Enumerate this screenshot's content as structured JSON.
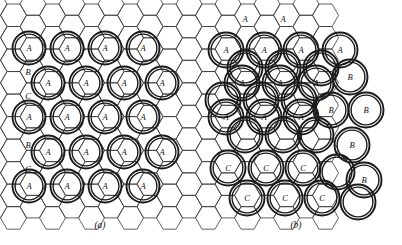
{
  "figure": {
    "type": "crystallography-stacking-diagram",
    "background_color": "#ffffff",
    "line_color": "#3a3a3a",
    "circle_color": "#1a1a1a",
    "width": 402,
    "height": 245
  },
  "panels": [
    {
      "id": "a",
      "caption": "(a)",
      "caption_x": 100,
      "caption_y": 228,
      "description": "ordered single-site occupation",
      "edge_labels": [
        {
          "text": "B",
          "x": 28,
          "y": 72
        },
        {
          "text": "C",
          "x": 28,
          "y": 96
        },
        {
          "text": "B",
          "x": 28,
          "y": 145
        },
        {
          "text": "C",
          "x": 28,
          "y": 169
        }
      ],
      "sites": [
        {
          "label": "A",
          "x": 29,
          "y": 48,
          "r": 16.5
        },
        {
          "label": "A",
          "x": 67,
          "y": 48,
          "r": 16.5
        },
        {
          "label": "A",
          "x": 105,
          "y": 48,
          "r": 16.5
        },
        {
          "label": "A",
          "x": 143,
          "y": 48,
          "r": 16.5
        },
        {
          "label": "A",
          "x": 48,
          "y": 83,
          "r": 16.5
        },
        {
          "label": "A",
          "x": 86,
          "y": 83,
          "r": 16.5
        },
        {
          "label": "A",
          "x": 124,
          "y": 83,
          "r": 16.5
        },
        {
          "label": "A",
          "x": 162,
          "y": 83,
          "r": 16.5
        },
        {
          "label": "A",
          "x": 29,
          "y": 117,
          "r": 16.5
        },
        {
          "label": "A",
          "x": 67,
          "y": 117,
          "r": 16.5
        },
        {
          "label": "A",
          "x": 105,
          "y": 117,
          "r": 16.5
        },
        {
          "label": "A",
          "x": 143,
          "y": 117,
          "r": 16.5
        },
        {
          "label": "A",
          "x": 48,
          "y": 152,
          "r": 16.5
        },
        {
          "label": "A",
          "x": 86,
          "y": 152,
          "r": 16.5
        },
        {
          "label": "A",
          "x": 124,
          "y": 152,
          "r": 16.5
        },
        {
          "label": "A",
          "x": 162,
          "y": 152,
          "r": 16.5
        },
        {
          "label": "A",
          "x": 29,
          "y": 186,
          "r": 16.5
        },
        {
          "label": "A",
          "x": 67,
          "y": 186,
          "r": 16.5
        },
        {
          "label": "A",
          "x": 105,
          "y": 186,
          "r": 16.5
        },
        {
          "label": "A",
          "x": 143,
          "y": 186,
          "r": 16.5
        }
      ]
    },
    {
      "id": "b",
      "caption": "(b)",
      "caption_x": 296,
      "caption_y": 228,
      "description": "mixed A / B / C domain occupation",
      "edge_labels": [
        {
          "text": "A",
          "x": 245,
          "y": 19
        },
        {
          "text": "A",
          "x": 283,
          "y": 19
        }
      ],
      "sites": [
        {
          "label": "A",
          "x": 226,
          "y": 50,
          "r": 17.5
        },
        {
          "label": "A",
          "x": 264,
          "y": 50,
          "r": 17.5
        },
        {
          "label": "A",
          "x": 301,
          "y": 50,
          "r": 17.5
        },
        {
          "label": "A",
          "x": 340,
          "y": 50,
          "r": 17.5
        },
        {
          "label": "",
          "x": 245,
          "y": 68,
          "r": 17.5
        },
        {
          "label": "",
          "x": 283,
          "y": 68,
          "r": 17.5
        },
        {
          "label": "",
          "x": 321,
          "y": 68,
          "r": 17.5
        },
        {
          "label": "A",
          "x": 242,
          "y": 83,
          "r": 17.5
        },
        {
          "label": "A",
          "x": 280,
          "y": 83,
          "r": 17.5
        },
        {
          "label": "A",
          "x": 316,
          "y": 83,
          "r": 17.5
        },
        {
          "label": "B",
          "x": 350,
          "y": 77,
          "r": 17.5
        },
        {
          "label": "",
          "x": 223,
          "y": 100,
          "r": 17.5
        },
        {
          "label": "",
          "x": 261,
          "y": 100,
          "r": 17.5
        },
        {
          "label": "",
          "x": 299,
          "y": 100,
          "r": 17.5
        },
        {
          "label": "A",
          "x": 226,
          "y": 117,
          "r": 17.5
        },
        {
          "label": "A",
          "x": 264,
          "y": 117,
          "r": 17.5
        },
        {
          "label": "A",
          "x": 301,
          "y": 117,
          "r": 17.5
        },
        {
          "label": "B",
          "x": 331,
          "y": 110,
          "r": 17.5
        },
        {
          "label": "B",
          "x": 366,
          "y": 110,
          "r": 17.5
        },
        {
          "label": "",
          "x": 245,
          "y": 135,
          "r": 17.5
        },
        {
          "label": "",
          "x": 283,
          "y": 135,
          "r": 17.5
        },
        {
          "label": "",
          "x": 316,
          "y": 135,
          "r": 17.5
        },
        {
          "label": "B",
          "x": 352,
          "y": 145,
          "r": 17.5
        },
        {
          "label": "C",
          "x": 228,
          "y": 168,
          "r": 17.5
        },
        {
          "label": "C",
          "x": 266,
          "y": 168,
          "r": 17.5
        },
        {
          "label": "C",
          "x": 303,
          "y": 168,
          "r": 17.5
        },
        {
          "label": "",
          "x": 337,
          "y": 172,
          "r": 17.5
        },
        {
          "label": "B",
          "x": 364,
          "y": 180,
          "r": 17.5
        },
        {
          "label": "C",
          "x": 247,
          "y": 198,
          "r": 17.5
        },
        {
          "label": "C",
          "x": 285,
          "y": 198,
          "r": 17.5
        },
        {
          "label": "C",
          "x": 322,
          "y": 198,
          "r": 17.5
        },
        {
          "label": "",
          "x": 358,
          "y": 202,
          "r": 17.5
        }
      ]
    }
  ],
  "lattice": {
    "hex_radius": 13.0,
    "origin_x": -6,
    "origin_y": 4,
    "cols": 18,
    "rows": 10
  }
}
